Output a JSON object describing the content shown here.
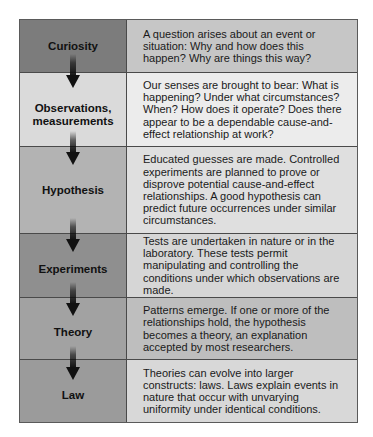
{
  "diagram": {
    "rows": [
      {
        "stage": "Curiosity",
        "description": "A question arises about an event or situation: Why and how does this happen? Why are things this way?",
        "stage_color": "#7c7c7c",
        "desc_color": "#c6c6c6"
      },
      {
        "stage": "Observations, measurements",
        "description": "Our senses are brought to bear: What is happening? Under what circumstances? When? How does it operate? Does there appear to be a dependable cause-and-effect relationship at work?",
        "stage_color": "#dadada",
        "desc_color": "#ececec"
      },
      {
        "stage": "Hypothesis",
        "description": "Educated guesses are made. Controlled experiments are planned to prove or disprove potential cause-and-effect relationships. A good hypothesis can predict future occurrences under similar circumstances.",
        "stage_color": "#b3b3b3",
        "desc_color": "#dfdfdf"
      },
      {
        "stage": "Experiments",
        "description": "Tests are undertaken in nature or in the laboratory. These tests permit manipulating and controlling the conditions under which observations are made.",
        "stage_color": "#8f8f8f",
        "desc_color": "#d6d6d6"
      },
      {
        "stage": "Theory",
        "description": "Patterns emerge. If one or more of the relationships hold, the hypothesis becomes a theory, an explanation accepted by most researchers.",
        "stage_color": "#a2a2a2",
        "desc_color": "#bebebe"
      },
      {
        "stage": "Law",
        "description": "Theories can evolve into larger constructs: laws. Laws explain events in nature that occur with unvarying uniformity under identical conditions.",
        "stage_color": "#9b9b9b",
        "desc_color": "#d8d8d8"
      }
    ],
    "arrow_icon": "down-arrow-icon",
    "border_color": "#4a4a4a"
  }
}
